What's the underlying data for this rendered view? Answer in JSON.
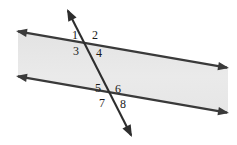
{
  "figure": {
    "width": 237,
    "height": 145
  },
  "colors": {
    "background": "#ffffff",
    "band_fill": "#e8e8e8",
    "band_fill_light": "#efefef",
    "line_stroke": "#3a3a3a",
    "transversal_stroke": "#2e2e2e",
    "label_text": "#1a1a1a"
  },
  "lines": {
    "top_parallel": {
      "name": "top parallel line",
      "x1": 16,
      "y1": 31,
      "x2": 229,
      "y2": 68,
      "arrow_start": "up-left",
      "arrow_end": "down-right"
    },
    "bottom_parallel": {
      "name": "bottom parallel line",
      "x1": 16,
      "y1": 76,
      "x2": 229,
      "y2": 113,
      "arrow_start": "up-left",
      "arrow_end": "down-right"
    },
    "transversal": {
      "name": "transversal line",
      "x1": 67,
      "y1": 9,
      "x2": 132,
      "y2": 137,
      "arrow_start": "up-right",
      "arrow_end": "down-right"
    }
  },
  "band": {
    "name": "shaded parallelogram band",
    "points": "18,32 228,68 228,113 18,77"
  },
  "intersections": {
    "upper": {
      "x": 88,
      "y": 43
    },
    "lower": {
      "x": 111,
      "y": 88
    }
  },
  "angle_labels": [
    {
      "id": "angle-1",
      "text": "1",
      "x": 72,
      "y": 29
    },
    {
      "id": "angle-2",
      "text": "2",
      "x": 92,
      "y": 29
    },
    {
      "id": "angle-3",
      "text": "3",
      "x": 73,
      "y": 45
    },
    {
      "id": "angle-4",
      "text": "4",
      "x": 96,
      "y": 47
    },
    {
      "id": "angle-5",
      "text": "5",
      "x": 95,
      "y": 82
    },
    {
      "id": "angle-6",
      "text": "6",
      "x": 115,
      "y": 83
    },
    {
      "id": "angle-7",
      "text": "7",
      "x": 99,
      "y": 97
    },
    {
      "id": "angle-8",
      "text": "8",
      "x": 120,
      "y": 98
    }
  ]
}
